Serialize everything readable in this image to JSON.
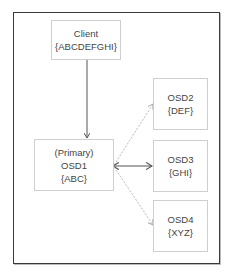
{
  "diagram": {
    "type": "flow",
    "nodes": [
      {
        "id": "client",
        "lines": [
          "Client",
          "{ABCDEFGHI}"
        ]
      },
      {
        "id": "osd1",
        "lines": [
          "(Primary)",
          "OSD1",
          "{ABC}"
        ]
      },
      {
        "id": "osd2",
        "lines": [
          "OSD2",
          "{DEF}"
        ]
      },
      {
        "id": "osd3",
        "lines": [
          "OSD3",
          "{GHI}"
        ]
      },
      {
        "id": "osd4",
        "lines": [
          "OSD4",
          "{XYZ}"
        ]
      }
    ],
    "edges": [
      {
        "from": "client",
        "to": "osd1",
        "style": "solid"
      },
      {
        "from": "osd1",
        "to": "osd2",
        "style": "dashed"
      },
      {
        "from": "osd1",
        "to": "osd3",
        "style": "solid"
      },
      {
        "from": "osd1",
        "to": "osd4",
        "style": "dashed"
      }
    ],
    "colors": {
      "frame": "#3a3a3a",
      "node_border": "#cfcfcf",
      "text": "#444444",
      "solid_edge": "#555555",
      "dashed_edge": "#b8b8b8"
    }
  }
}
